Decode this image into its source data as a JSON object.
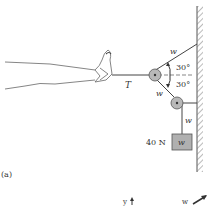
{
  "figure": {
    "panel_label": "(a)",
    "tension_label": "T",
    "rope_labels": {
      "upper": "w",
      "lower_diagonal": "w",
      "vertical": "w"
    },
    "angles": {
      "upper": "30°",
      "lower": "30°"
    },
    "weight": {
      "value_label": "40 N",
      "box_label": "w"
    },
    "axis_fragments": {
      "y_label": "y",
      "w_label": "w"
    }
  },
  "colors": {
    "line": "#444444",
    "pulley_fill": "#b8b8b8",
    "weight_fill": "#b0b0b0",
    "wall_hatch": "#777777"
  }
}
